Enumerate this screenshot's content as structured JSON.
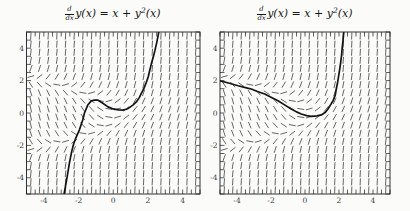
{
  "page": {
    "background": "#fbfbfa"
  },
  "figure": {
    "title_math": {
      "frac_num": "d",
      "frac_den": "dx",
      "body_main": "y(x) = x + y",
      "body_sup": "2",
      "body_tail": "(x)"
    }
  },
  "colors": {
    "frame": "#1c1c1c",
    "tick_label": "#3a3a3a",
    "field_dash": "#3f3f3f",
    "curve": "#141414",
    "title": "#151515"
  },
  "chart_data": [
    {
      "type": "line",
      "title": "d/dx y(x) = x + y^2(x)",
      "xlabel": "",
      "ylabel": "",
      "xlim": [
        -5,
        5
      ],
      "ylim": [
        -5,
        5
      ],
      "xtick_values": [
        -4,
        -2,
        0,
        2,
        4
      ],
      "xtick_labels": [
        "-4",
        "-2",
        "0",
        "2",
        "4"
      ],
      "ytick_values": [
        -4,
        -2,
        0,
        2,
        4
      ],
      "ytick_labels": [
        "-4",
        "-2",
        "0",
        "2",
        "4"
      ],
      "minor_tick_step": 0.5,
      "grid": false,
      "legend": false,
      "direction_field": {
        "slope_expression": "x + y*y",
        "grid_start": -4.75,
        "grid_end": 4.75,
        "grid_step": 0.5,
        "segment_length_px": 7
      },
      "solution_curve": {
        "x": [
          -2.85,
          -2.65,
          -2.52,
          -2.4,
          -2.28,
          -2.14,
          -1.95,
          -1.76,
          -1.66,
          -1.47,
          -1.28,
          -1.1,
          -0.9,
          -0.6,
          -0.3,
          0.0,
          0.3,
          0.56,
          0.8,
          0.95,
          1.15,
          1.33,
          1.5,
          1.62,
          1.78,
          1.91,
          2.02,
          2.1,
          2.2,
          2.3,
          2.4,
          2.49,
          2.58,
          2.65
        ],
        "y": [
          -5.1,
          -3.9,
          -3.05,
          -2.4,
          -1.9,
          -1.5,
          -1.04,
          -0.43,
          0.0,
          0.49,
          0.73,
          0.8,
          0.8,
          0.6,
          0.38,
          0.25,
          0.19,
          0.18,
          0.25,
          0.35,
          0.5,
          0.68,
          0.95,
          1.21,
          1.55,
          1.9,
          2.25,
          2.62,
          3.05,
          3.43,
          3.85,
          4.27,
          4.75,
          5.15
        ]
      }
    },
    {
      "type": "line",
      "title": "d/dx y(x) = x + y^2(x)",
      "xlabel": "",
      "ylabel": "",
      "xlim": [
        -5,
        5
      ],
      "ylim": [
        -5,
        5
      ],
      "xtick_values": [
        -4,
        -2,
        0,
        2,
        4
      ],
      "xtick_labels": [
        "-4",
        "-2",
        "0",
        "2",
        "4"
      ],
      "ytick_values": [
        -4,
        -2,
        0,
        2,
        4
      ],
      "ytick_labels": [
        "-4",
        "-2",
        "0",
        "2",
        "4"
      ],
      "minor_tick_step": 0.5,
      "grid": false,
      "legend": false,
      "direction_field": {
        "slope_expression": "x + y*y",
        "grid_start": -4.75,
        "grid_end": 4.75,
        "grid_step": 0.5,
        "segment_length_px": 7
      },
      "solution_curve": {
        "x": [
          -5.0,
          -4.5,
          -3.94,
          -3.5,
          -3.16,
          -2.8,
          -2.37,
          -2.0,
          -1.59,
          -1.2,
          -0.81,
          -0.5,
          -0.22,
          0.1,
          0.37,
          0.7,
          0.96,
          1.2,
          1.35,
          1.5,
          1.65,
          1.78,
          1.84,
          1.92,
          1.98,
          2.05,
          2.1,
          2.15,
          2.18,
          2.23,
          2.26,
          2.3
        ],
        "y": [
          1.99,
          1.85,
          1.68,
          1.57,
          1.48,
          1.33,
          1.17,
          0.97,
          0.76,
          0.5,
          0.25,
          0.07,
          -0.06,
          -0.16,
          -0.21,
          -0.18,
          -0.12,
          0.05,
          0.25,
          0.5,
          0.76,
          1.1,
          1.48,
          1.9,
          2.29,
          2.75,
          3.12,
          3.55,
          3.94,
          4.4,
          4.76,
          5.2
        ]
      }
    }
  ]
}
